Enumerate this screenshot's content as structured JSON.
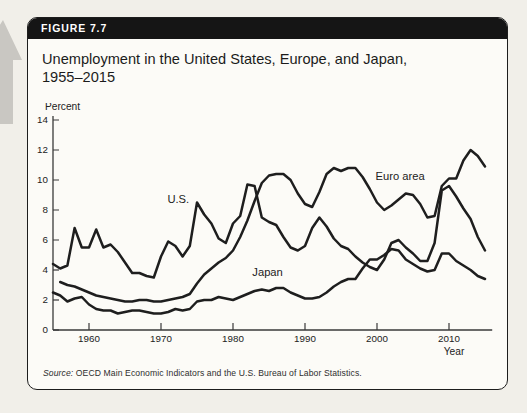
{
  "figure": {
    "label": "FIGURE 7.7",
    "title_line1": "Unemployment in the United States, Europe, and Japan,",
    "title_line2": "1955–2015",
    "source_prefix": "Source:",
    "source_text": " OECD Main Economic Indicators and the U.S. Bureau of Labor Statistics."
  },
  "colors": {
    "header_bg": "#151515",
    "header_text": "#ffffff",
    "card_bg": "#fcfbf7",
    "page_bg": "#f1efe9",
    "data_line": "#1e1e1e",
    "axis": "#3a3a3a",
    "tick_text": "#222222",
    "nav_arrow": "#c9c7c2"
  },
  "chart_data": {
    "type": "line",
    "title": "Unemployment in the United States, Europe, and Japan, 1955–2015",
    "ylabel": "Percent",
    "xlabel": "Year",
    "ylim": [
      0,
      14
    ],
    "xlim": [
      1955,
      2016
    ],
    "y_ticks": [
      0,
      2,
      4,
      6,
      8,
      10,
      12,
      14
    ],
    "x_ticks": [
      1960,
      1970,
      1980,
      1990,
      2000,
      2010
    ],
    "grid": false,
    "legend": "inline-labels",
    "series": [
      {
        "name": "U.S.",
        "start_year": 1955,
        "label_pos": {
          "x": 1972.4,
          "y": 8.75
        },
        "values": [
          4.4,
          4.1,
          4.3,
          6.8,
          5.5,
          5.5,
          6.7,
          5.5,
          5.7,
          5.2,
          4.5,
          3.8,
          3.8,
          3.6,
          3.5,
          4.9,
          5.9,
          5.6,
          4.9,
          5.6,
          8.5,
          7.7,
          7.1,
          6.1,
          5.8,
          7.1,
          7.6,
          9.7,
          9.6,
          7.5,
          7.2,
          7.0,
          6.2,
          5.5,
          5.3,
          5.6,
          6.8,
          7.5,
          6.9,
          6.1,
          5.6,
          5.4,
          4.9,
          4.5,
          4.2,
          4.0,
          4.7,
          5.8,
          6.0,
          5.5,
          5.1,
          4.6,
          4.6,
          5.8,
          9.3,
          9.6,
          8.9,
          8.1,
          7.4,
          6.2,
          5.3
        ]
      },
      {
        "name": "Euro area",
        "start_year": 1956,
        "label_pos": {
          "x": 2003.2,
          "y": 10.3
        },
        "values": [
          3.2,
          3.0,
          2.9,
          2.7,
          2.5,
          2.3,
          2.2,
          2.1,
          2.0,
          1.9,
          1.9,
          2.0,
          2.0,
          1.9,
          1.9,
          2.0,
          2.1,
          2.2,
          2.4,
          3.1,
          3.7,
          4.1,
          4.5,
          4.8,
          5.3,
          6.2,
          7.3,
          8.6,
          9.8,
          10.3,
          10.4,
          10.4,
          10.0,
          9.1,
          8.4,
          8.2,
          9.2,
          10.4,
          10.8,
          10.6,
          10.8,
          10.8,
          10.2,
          9.4,
          8.5,
          8.0,
          8.3,
          8.7,
          9.1,
          9.0,
          8.4,
          7.5,
          7.6,
          9.6,
          10.1,
          10.1,
          11.3,
          12.0,
          11.6,
          10.9
        ]
      },
      {
        "name": "Japan",
        "start_year": 1955,
        "label_pos": {
          "x": 1984.8,
          "y": 3.85
        },
        "values": [
          2.5,
          2.3,
          1.9,
          2.1,
          2.2,
          1.7,
          1.4,
          1.3,
          1.3,
          1.1,
          1.2,
          1.3,
          1.3,
          1.2,
          1.1,
          1.1,
          1.2,
          1.4,
          1.3,
          1.4,
          1.9,
          2.0,
          2.0,
          2.2,
          2.1,
          2.0,
          2.2,
          2.4,
          2.6,
          2.7,
          2.6,
          2.8,
          2.8,
          2.5,
          2.3,
          2.1,
          2.1,
          2.2,
          2.5,
          2.9,
          3.2,
          3.4,
          3.4,
          4.1,
          4.7,
          4.7,
          5.0,
          5.4,
          5.3,
          4.7,
          4.4,
          4.1,
          3.9,
          4.0,
          5.1,
          5.1,
          4.6,
          4.3,
          4.0,
          3.6,
          3.4
        ]
      }
    ]
  }
}
